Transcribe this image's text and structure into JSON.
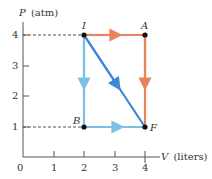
{
  "diagram": {
    "y_axis": {
      "symbol": "P",
      "unit_label": "(atm)",
      "ticks": [
        "1",
        "2",
        "3",
        "4"
      ]
    },
    "x_axis": {
      "symbol": "V",
      "unit_label": "(liters)",
      "origin_label": "0",
      "ticks": [
        "1",
        "2",
        "3",
        "4"
      ]
    },
    "points": {
      "I": {
        "label": "I",
        "V": 2,
        "P": 4
      },
      "A": {
        "label": "A",
        "V": 4,
        "P": 4
      },
      "B": {
        "label": "B",
        "V": 2,
        "P": 1
      },
      "F": {
        "label": "F",
        "V": 4,
        "P": 1
      }
    },
    "paths": [
      {
        "name": "IAF",
        "segments": [
          "I->A",
          "A->F"
        ],
        "color": "#e8845a"
      },
      {
        "name": "IBF",
        "segments": [
          "I->B",
          "B->F"
        ],
        "color": "#7cc0e8"
      },
      {
        "name": "IF",
        "segments": [
          "I->F"
        ],
        "color": "#3d87d8"
      }
    ],
    "colors": {
      "axis": "#555555",
      "dashed_guide": "#555555",
      "point": "#111111"
    }
  }
}
